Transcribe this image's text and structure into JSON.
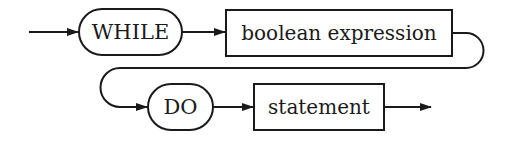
{
  "diagram": {
    "type": "syntax-diagram",
    "title": "",
    "nodes": [
      {
        "id": "while",
        "kind": "terminal",
        "shape": "rounded",
        "label": "WHILE"
      },
      {
        "id": "bool",
        "kind": "nonterminal",
        "shape": "rectangle",
        "label": "boolean expression"
      },
      {
        "id": "do",
        "kind": "terminal",
        "shape": "rounded",
        "label": "DO"
      },
      {
        "id": "stmt",
        "kind": "nonterminal",
        "shape": "rectangle",
        "label": "statement"
      }
    ],
    "edges": [
      {
        "from": "entry",
        "to": "while"
      },
      {
        "from": "while",
        "to": "bool"
      },
      {
        "from": "bool",
        "to": "do"
      },
      {
        "from": "do",
        "to": "stmt"
      },
      {
        "from": "stmt",
        "to": "exit"
      }
    ],
    "colors": {
      "stroke": "#1a1a1a",
      "background": "#ffffff"
    }
  }
}
